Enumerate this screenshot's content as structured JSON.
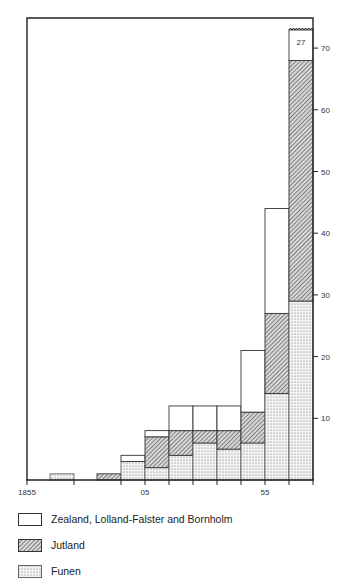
{
  "chart_data": {
    "type": "bar",
    "subtype": "stacked-step-histogram",
    "title": "",
    "xlabel": "",
    "ylabel": "",
    "ylim": [
      0,
      74
    ],
    "y_ticks": [
      10,
      20,
      30,
      40,
      50,
      60,
      70
    ],
    "y_axis_side": "right",
    "x_tick_labels": [
      {
        "label": "1855",
        "pos": 27
      },
      {
        "label": "05",
        "pos": 145
      },
      {
        "label": "55",
        "pos": 265
      }
    ],
    "x_ticks_px": [
      27,
      74,
      121,
      145,
      169,
      193,
      217,
      241,
      265,
      289,
      313
    ],
    "columns": [
      {
        "x0": 50,
        "x1": 74,
        "Funen": 1,
        "Jutland": 0,
        "Zealand": 0
      },
      {
        "x0": 97,
        "x1": 121,
        "Funen": 0,
        "Jutland": 1,
        "Zealand": 0
      },
      {
        "x0": 121,
        "x1": 145,
        "Funen": 3,
        "Jutland": 0,
        "Zealand": 1
      },
      {
        "x0": 145,
        "x1": 169,
        "Funen": 2,
        "Jutland": 5,
        "Zealand": 1
      },
      {
        "x0": 169,
        "x1": 193,
        "Funen": 4,
        "Jutland": 4,
        "Zealand": 4
      },
      {
        "x0": 193,
        "x1": 217,
        "Funen": 6,
        "Jutland": 2,
        "Zealand": 4
      },
      {
        "x0": 217,
        "x1": 241,
        "Funen": 5,
        "Jutland": 3,
        "Zealand": 4
      },
      {
        "x0": 241,
        "x1": 265,
        "Funen": 6,
        "Jutland": 5,
        "Zealand": 10
      },
      {
        "x0": 265,
        "x1": 289,
        "Funen": 14,
        "Jutland": 13,
        "Zealand": 17
      },
      {
        "x0": 289,
        "x1": 313,
        "Funen": 29,
        "Jutland": 39,
        "Zealand": 27,
        "broken": true
      }
    ],
    "series": [
      {
        "name": "Zealand, Lolland-Falster and Bornholm",
        "pattern": "blank",
        "values": [
          0,
          0,
          1,
          1,
          4,
          4,
          4,
          10,
          17,
          27
        ]
      },
      {
        "name": "Jutland",
        "pattern": "hatched",
        "values": [
          0,
          1,
          0,
          5,
          4,
          2,
          3,
          5,
          13,
          39
        ]
      },
      {
        "name": "Funen",
        "pattern": "dotted",
        "values": [
          1,
          0,
          3,
          2,
          4,
          6,
          5,
          6,
          14,
          29
        ]
      }
    ],
    "annotations": [
      {
        "text": "27",
        "column": 9,
        "note": "broken bar value"
      }
    ],
    "legend_position": "bottom",
    "grid": false
  },
  "legend": {
    "items": [
      {
        "label": "Zealand, Lolland-Falster and Bornholm",
        "pattern": "blank"
      },
      {
        "label": "Jutland",
        "pattern": "hatched"
      },
      {
        "label": "Funen",
        "pattern": "dotted"
      }
    ]
  },
  "annotation_label": "27",
  "colors": {
    "ink": "#222222",
    "hatch": "#555555",
    "dot": "#777777",
    "paper": "#ffffff"
  }
}
